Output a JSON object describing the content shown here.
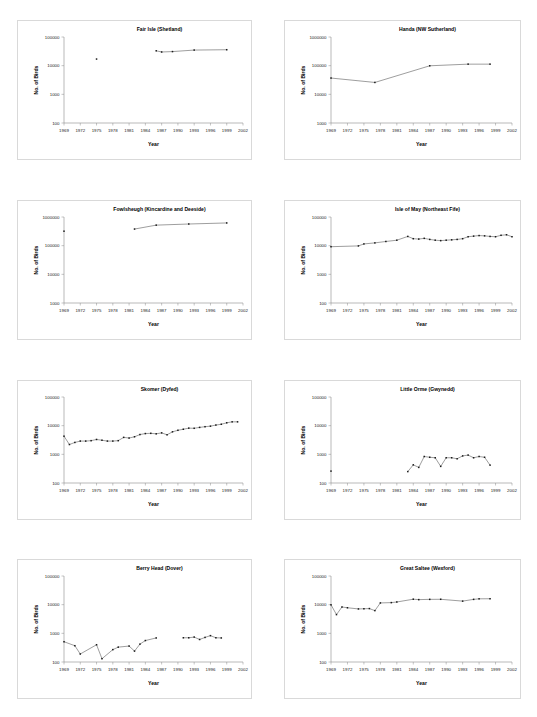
{
  "page": {
    "top_note": "",
    "axis_titles": {
      "x": "Year",
      "y": "No. of Birds"
    },
    "x_ticks": [
      1969,
      1972,
      1975,
      1978,
      1981,
      1984,
      1987,
      1990,
      1993,
      1996,
      1999,
      2002
    ],
    "x_range": [
      1969,
      2002
    ]
  },
  "chart_data": [
    {
      "type": "line",
      "title": "Fair Isle (Shetland)",
      "xlabel": "Year",
      "ylabel": "No. of Birds",
      "yscale": "log",
      "ylim": [
        100,
        100000
      ],
      "ytick_labels": [
        "100",
        "1000",
        "10000",
        "100000"
      ],
      "yticks": [
        100,
        1000,
        10000,
        100000
      ],
      "grid": false,
      "legend": "none",
      "x": [
        1975,
        1986,
        1987,
        1989,
        1993,
        1999
      ],
      "values": [
        17000,
        33000,
        30000,
        31000,
        35000,
        36000
      ],
      "segments": [
        [
          1975
        ],
        [
          1986,
          1987,
          1989,
          1993,
          1999
        ]
      ]
    },
    {
      "type": "line",
      "title": "Handa (NW Sutherland)",
      "xlabel": "Year",
      "ylabel": "No. of Birds",
      "yscale": "log",
      "ylim": [
        1000,
        1000000
      ],
      "ytick_labels": [
        "1000",
        "10000",
        "100000",
        "1000000"
      ],
      "yticks": [
        1000,
        10000,
        100000,
        1000000
      ],
      "grid": false,
      "legend": "none",
      "x": [
        1969,
        1977,
        1987,
        1994,
        1998
      ],
      "values": [
        37000,
        26000,
        99000,
        113000,
        113000
      ],
      "segments": [
        [
          1969,
          1977,
          1987,
          1994,
          1998
        ]
      ]
    },
    {
      "type": "line",
      "title": "Fowlsheugh (Kincardine and Deeside)",
      "xlabel": "Year",
      "ylabel": "No. of Birds",
      "yscale": "log",
      "ylim": [
        1000,
        1000000
      ],
      "ytick_labels": [
        "1000",
        "10000",
        "100000",
        "1000000"
      ],
      "yticks": [
        1000,
        10000,
        100000,
        1000000
      ],
      "grid": false,
      "legend": "none",
      "x": [
        1969,
        1982,
        1986,
        1992,
        1999
      ],
      "values": [
        320000,
        380000,
        520000,
        570000,
        620000
      ],
      "segments": [
        [
          1969
        ],
        [
          1982,
          1986,
          1992,
          1999
        ]
      ]
    },
    {
      "type": "line",
      "title": "Isle of May (Northeast Fife)",
      "xlabel": "Year",
      "ylabel": "No. of Birds",
      "yscale": "log",
      "ylim": [
        100,
        100000
      ],
      "ytick_labels": [
        "100",
        "1000",
        "10000",
        "100000"
      ],
      "yticks": [
        100,
        1000,
        10000,
        100000
      ],
      "grid": false,
      "legend": "none",
      "x": [
        1969,
        1974,
        1975,
        1977,
        1979,
        1981,
        1983,
        1984,
        1985,
        1986,
        1987,
        1988,
        1989,
        1990,
        1991,
        1992,
        1993,
        1994,
        1995,
        1996,
        1997,
        1998,
        1999,
        2000,
        2001,
        2002
      ],
      "values": [
        9200,
        9800,
        11500,
        12500,
        14000,
        15500,
        21000,
        17500,
        17000,
        18000,
        16500,
        15500,
        15000,
        15500,
        16000,
        16500,
        17500,
        20500,
        21500,
        22500,
        22000,
        21000,
        20500,
        23000,
        24000,
        20500
      ],
      "segments": [
        [
          1969,
          1974,
          1975,
          1977,
          1979,
          1981,
          1983,
          1984,
          1985,
          1986,
          1987,
          1988,
          1989,
          1990,
          1991,
          1992,
          1993,
          1994,
          1995,
          1996,
          1997,
          1998,
          1999,
          2000,
          2001,
          2002
        ]
      ]
    },
    {
      "type": "line",
      "title": "Skomer (Dyfed)",
      "xlabel": "Year",
      "ylabel": "No. of Birds",
      "yscale": "log",
      "ylim": [
        100,
        100000
      ],
      "ytick_labels": [
        "100",
        "1000",
        "10000",
        "100000"
      ],
      "yticks": [
        100,
        1000,
        10000,
        100000
      ],
      "grid": false,
      "legend": "none",
      "x": [
        1969,
        1970,
        1971,
        1972,
        1973,
        1974,
        1975,
        1976,
        1977,
        1978,
        1979,
        1980,
        1981,
        1982,
        1983,
        1984,
        1985,
        1986,
        1987,
        1988,
        1989,
        1990,
        1991,
        1992,
        1993,
        1994,
        1995,
        1996,
        1997,
        1998,
        1999,
        2000,
        2001
      ],
      "values": [
        4300,
        2200,
        2600,
        2900,
        2900,
        3000,
        3300,
        3100,
        2900,
        2900,
        3000,
        3900,
        3700,
        4100,
        4900,
        5300,
        5400,
        5200,
        5600,
        4800,
        6100,
        6900,
        7500,
        8200,
        8100,
        8700,
        9200,
        9600,
        10500,
        11200,
        12600,
        13600,
        13600
      ],
      "segments": [
        [
          1969,
          1970,
          1971,
          1972,
          1973,
          1974,
          1975,
          1976,
          1977,
          1978,
          1979,
          1980,
          1981,
          1982,
          1983,
          1984,
          1985,
          1986,
          1987,
          1988,
          1989,
          1990,
          1991,
          1992,
          1993,
          1994,
          1995,
          1996,
          1997,
          1998,
          1999,
          2000,
          2001
        ]
      ]
    },
    {
      "type": "line",
      "title": "Little Orme (Gwynedd)",
      "xlabel": "Year",
      "ylabel": "No. of Birds",
      "yscale": "log",
      "ylim": [
        100,
        100000
      ],
      "ytick_labels": [
        "100",
        "1000",
        "10000",
        "100000"
      ],
      "yticks": [
        100,
        1000,
        10000,
        100000
      ],
      "grid": false,
      "legend": "none",
      "x": [
        1969,
        1983,
        1984,
        1985,
        1986,
        1987,
        1988,
        1989,
        1990,
        1991,
        1992,
        1993,
        1994,
        1995,
        1996,
        1997,
        1998
      ],
      "values": [
        260,
        250,
        430,
        350,
        840,
        790,
        760,
        380,
        760,
        760,
        700,
        880,
        940,
        760,
        840,
        790,
        420
      ],
      "segments": [
        [
          1969
        ],
        [
          1983,
          1984,
          1985,
          1986,
          1987,
          1988,
          1989,
          1990,
          1991,
          1992,
          1993,
          1994,
          1995,
          1996,
          1997,
          1998
        ]
      ]
    },
    {
      "type": "line",
      "title": "Berry Head (Dover)",
      "xlabel": "Year",
      "ylabel": "No. of Birds",
      "yscale": "log",
      "ylim": [
        100,
        100000
      ],
      "ytick_labels": [
        "100",
        "1000",
        "10000",
        "100000"
      ],
      "yticks": [
        100,
        1000,
        10000,
        100000
      ],
      "grid": false,
      "legend": "none",
      "x": [
        1969,
        1971,
        1972,
        1975,
        1976,
        1978,
        1979,
        1981,
        1982,
        1983,
        1984,
        1986,
        1991,
        1992,
        1993,
        1994,
        1995,
        1996,
        1997,
        1998
      ],
      "values": [
        510,
        370,
        190,
        400,
        130,
        270,
        330,
        360,
        240,
        420,
        560,
        690,
        700,
        700,
        740,
        610,
        720,
        830,
        700,
        690
      ],
      "segments": [
        [
          1969,
          1971,
          1972,
          1975,
          1976,
          1978,
          1979,
          1981,
          1982,
          1983,
          1984,
          1986
        ],
        [
          1991,
          1992,
          1993,
          1994,
          1995,
          1996,
          1997,
          1998
        ]
      ]
    },
    {
      "type": "line",
      "title": "Great Saltee (Wexford)",
      "xlabel": "Year",
      "ylabel": "No. of Birds",
      "yscale": "log",
      "ylim": [
        100,
        100000
      ],
      "ytick_labels": [
        "100",
        "1000",
        "10000",
        "100000"
      ],
      "yticks": [
        100,
        1000,
        10000,
        100000
      ],
      "grid": false,
      "legend": "none",
      "x": [
        1969,
        1970,
        1971,
        1972,
        1974,
        1975,
        1976,
        1977,
        1978,
        1980,
        1981,
        1984,
        1985,
        1987,
        1989,
        1993,
        1995,
        1996,
        1998
      ],
      "values": [
        9900,
        4500,
        8300,
        7800,
        7100,
        7200,
        7300,
        6200,
        11500,
        11800,
        12400,
        15500,
        15000,
        15300,
        15400,
        13300,
        15300,
        16000,
        16100
      ],
      "segments": [
        [
          1969,
          1970,
          1971,
          1972,
          1974,
          1975,
          1976,
          1977,
          1978,
          1980,
          1981,
          1984,
          1985,
          1987,
          1989,
          1993,
          1995,
          1996,
          1998
        ]
      ]
    }
  ]
}
